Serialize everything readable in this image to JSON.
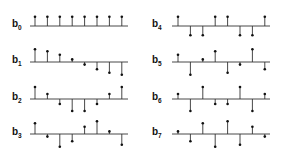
{
  "figure": {
    "title": "",
    "colors": {
      "stroke": "#333333",
      "marker": "#111111",
      "background": "#ffffff"
    }
  },
  "panels": [
    {
      "label": "b",
      "index": "0"
    },
    {
      "label": "b",
      "index": "1"
    },
    {
      "label": "b",
      "index": "2"
    },
    {
      "label": "b",
      "index": "3"
    },
    {
      "label": "b",
      "index": "4"
    },
    {
      "label": "b",
      "index": "5"
    },
    {
      "label": "b",
      "index": "6"
    },
    {
      "label": "b",
      "index": "7"
    }
  ],
  "chart_data": {
    "type": "stem",
    "title": "",
    "xlabel": "",
    "ylabel": "",
    "x": [
      0,
      1,
      2,
      3,
      4,
      5,
      6,
      7
    ],
    "grid": false,
    "layout": "2 columns x 4 rows (b0-b3 left, b4-b7 right)",
    "series": [
      {
        "name": "b0",
        "values": [
          0.71,
          0.71,
          0.71,
          0.71,
          0.71,
          0.71,
          0.71,
          0.71
        ]
      },
      {
        "name": "b1",
        "values": [
          0.98,
          0.83,
          0.56,
          0.2,
          -0.2,
          -0.56,
          -0.83,
          -0.98
        ]
      },
      {
        "name": "b2",
        "values": [
          0.92,
          0.38,
          -0.38,
          -0.92,
          -0.92,
          -0.38,
          0.38,
          0.92
        ]
      },
      {
        "name": "b3",
        "values": [
          0.83,
          -0.2,
          -0.98,
          -0.56,
          0.56,
          0.98,
          0.2,
          -0.83
        ]
      },
      {
        "name": "b4",
        "values": [
          0.71,
          -0.71,
          -0.71,
          0.71,
          0.71,
          -0.71,
          -0.71,
          0.71
        ]
      },
      {
        "name": "b5",
        "values": [
          0.56,
          -0.98,
          0.2,
          0.83,
          -0.83,
          -0.2,
          0.98,
          -0.56
        ]
      },
      {
        "name": "b6",
        "values": [
          0.38,
          -0.92,
          0.92,
          -0.38,
          -0.38,
          0.92,
          -0.92,
          0.38
        ]
      },
      {
        "name": "b7",
        "values": [
          0.2,
          -0.56,
          0.83,
          -0.98,
          0.98,
          -0.83,
          0.56,
          -0.2
        ]
      }
    ],
    "ylim": [
      -1,
      1
    ]
  }
}
